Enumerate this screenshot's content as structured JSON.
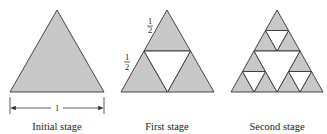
{
  "figure": {
    "colors": {
      "fill": "#c8c8c8",
      "hole": "#ffffff",
      "stroke": "#333333"
    },
    "stages": [
      {
        "caption": "Initial stage",
        "level": 0
      },
      {
        "caption": "First stage",
        "level": 1
      },
      {
        "caption": "Second stage",
        "level": 2
      }
    ],
    "dimension_label": "1",
    "side_labels": [
      {
        "numerator": "1",
        "denominator": "2"
      },
      {
        "numerator": "1",
        "denominator": "2"
      }
    ]
  }
}
